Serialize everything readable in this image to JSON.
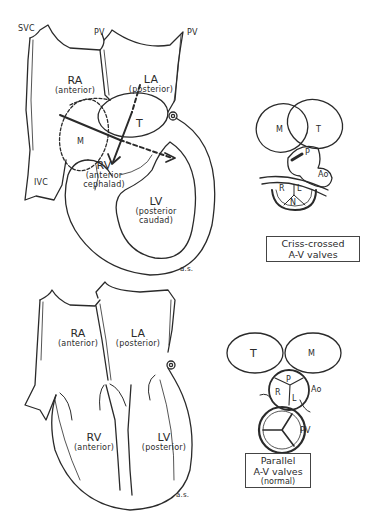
{
  "top_diagram": {
    "vessels": {
      "svc": "SVC",
      "pv_left": "PV",
      "pv_right": "PV",
      "ivc": "IVC"
    },
    "ra": {
      "name": "RA",
      "position": "(anterior)"
    },
    "la": {
      "name": "LA",
      "position": "(posterior)"
    },
    "rv": {
      "name": "RV",
      "position_line1": "(anterior",
      "position_line2": "cephalad)"
    },
    "lv": {
      "name": "LV",
      "position_line1": "(posterior",
      "position_line2": "caudad)"
    },
    "valves": {
      "mitral": "M",
      "tricuspid": "T"
    },
    "signature": "a.s."
  },
  "top_inset": {
    "valves": {
      "mitral": "M",
      "tricuspid": "T",
      "pulmonary": "P",
      "aortic": "Ao",
      "right": "R",
      "left": "L",
      "noncoronary": "N"
    },
    "caption_line1": "Criss-crossed",
    "caption_line2": "A-V valves"
  },
  "bottom_diagram": {
    "ra": {
      "name": "RA",
      "position": "(anterior)"
    },
    "la": {
      "name": "LA",
      "position": "(posterior)"
    },
    "rv": {
      "name": "RV",
      "position": "(anterior)"
    },
    "lv": {
      "name": "LV",
      "position": "(posterior)"
    },
    "signature": "a.s."
  },
  "bottom_inset": {
    "valves": {
      "tricuspid": "T",
      "mitral": "M",
      "pulmonary": "P",
      "right": "R",
      "left": "L",
      "aortic": "Ao",
      "pulmonary_valve": "PV"
    },
    "caption_line1": "Parallel",
    "caption_line2": "A-V valves",
    "caption_line3": "(normal)"
  },
  "colors": {
    "ink": "#2a2a2a",
    "background": "#ffffff"
  }
}
